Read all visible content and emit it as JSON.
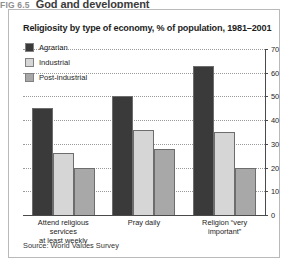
{
  "figure": {
    "number": "FIG 6.5",
    "heading": "God and development"
  },
  "chart_title": "Religiosity by type of economy, % of population, 1981–2001",
  "source": "Source: World Values Survey",
  "legend": {
    "items": [
      {
        "label": "Agrarian",
        "color": "#3a3a3a"
      },
      {
        "label": "Industrial",
        "color": "#d6d6d6"
      },
      {
        "label": "Post-industrial",
        "color": "#a8a8a8"
      }
    ]
  },
  "axis": {
    "ticks": [
      "0",
      "10",
      "20",
      "30",
      "40",
      "50",
      "60",
      "70"
    ],
    "position": "right"
  },
  "chart_data": {
    "type": "bar",
    "title": "Religiosity by type of economy, % of population, 1981–2001",
    "xlabel": "",
    "ylabel": "% of population",
    "ylim": [
      0,
      70
    ],
    "yticks": [
      0,
      10,
      20,
      30,
      40,
      50,
      60,
      70
    ],
    "grid": true,
    "legend_position": "top-left",
    "categories": [
      "Attend religious services at least weekly",
      "Pray daily",
      "Religion “very important”"
    ],
    "series": [
      {
        "name": "Agrarian",
        "color": "#3a3a3a",
        "values": [
          45,
          50,
          63
        ]
      },
      {
        "name": "Industrial",
        "color": "#d6d6d6",
        "values": [
          26,
          36,
          35
        ]
      },
      {
        "name": "Post-industrial",
        "color": "#a8a8a8",
        "values": [
          20,
          28,
          20
        ]
      }
    ],
    "source": "Source: World Values Survey"
  },
  "x_labels": [
    {
      "line1": "Attend religious services",
      "line2": "at least weekly"
    },
    {
      "line1": "Pray daily",
      "line2": ""
    },
    {
      "line1": "Religion “very important”",
      "line2": ""
    }
  ]
}
